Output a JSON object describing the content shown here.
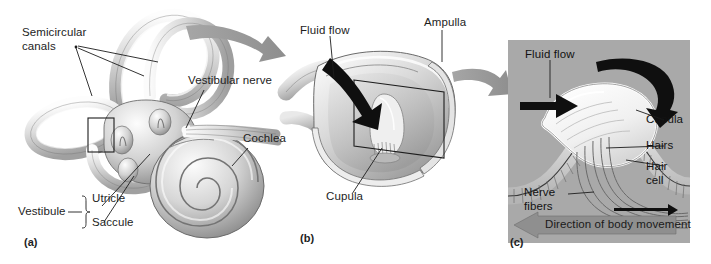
{
  "figure": {
    "background": "#ffffff",
    "panel_c_background": "#a9a9a9"
  },
  "panel_a": {
    "tag": "(a)",
    "labels": {
      "semicircular_canals": "Semicircular\ncanals",
      "semicircular_canals_line1": "Semicircular",
      "semicircular_canals_line2": "canals",
      "vestibular_nerve": "Vestibular nerve",
      "cochlea": "Cochlea",
      "vestibule": "Vestibule",
      "utricle": "Utricle",
      "saccule": "Saccule"
    }
  },
  "panel_b": {
    "tag": "(b)",
    "labels": {
      "fluid_flow": "Fluid flow",
      "ampulla": "Ampulla",
      "cupula": "Cupula"
    }
  },
  "panel_c": {
    "tag": "(c)",
    "labels": {
      "fluid_flow": "Fluid flow",
      "cupula": "Cupula",
      "hairs": "Hairs",
      "hair_cell_line1": "Hair",
      "hair_cell_line2": "cell",
      "nerve_fibers_line1": "Nerve",
      "nerve_fibers_line2": "fibers",
      "direction_banner": "Direction of body movement"
    }
  },
  "colors": {
    "ink": "#1d1d1d",
    "tissue_light": "#f2f2f2",
    "tissue_mid": "#c9c9c9",
    "tissue_dark": "#9a9a9a",
    "transition_arrow": "#9d9d9d",
    "black_arrow": "#101010",
    "panel_c_bg": "#a9a9a9",
    "banner_gray": "#8f8f8f"
  }
}
